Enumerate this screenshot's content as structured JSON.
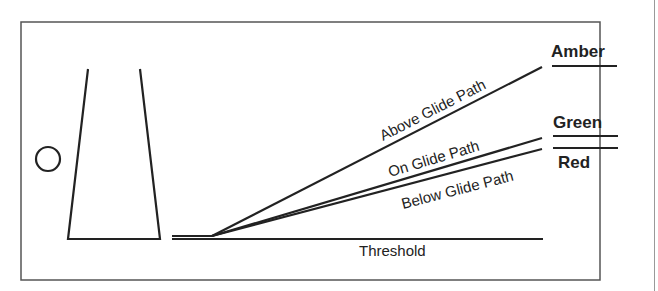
{
  "diagram": {
    "type": "glideslope-indicator",
    "lines": {
      "above": {
        "label": "Above Glide Path"
      },
      "on": {
        "label": "On Glide Path"
      },
      "below": {
        "label": "Below Glide Path"
      },
      "threshold": {
        "label": "Threshold"
      }
    },
    "indicators": {
      "amber": {
        "label": "Amber"
      },
      "green": {
        "label": "Green"
      },
      "red": {
        "label": "Red"
      }
    },
    "colors": {
      "stroke": "#222222",
      "frame": "#555555",
      "background": "#ffffff"
    }
  }
}
